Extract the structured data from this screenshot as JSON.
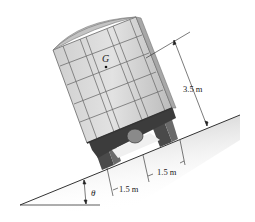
{
  "figure": {
    "labels": {
      "center_of_gravity": "G",
      "height": "3.5 m",
      "wheel_offset_left": "1.5 m",
      "wheel_offset_right": "1.5 m",
      "angle": "θ"
    },
    "colors": {
      "body": "#d9d9d9",
      "body_lines": "#6e6e6e",
      "roof": "#c4c4c4",
      "undercarriage": "#3c3c3c",
      "wheels": "#555555",
      "ground": "#cfcfcf",
      "dimension_lines": "#222222"
    }
  }
}
